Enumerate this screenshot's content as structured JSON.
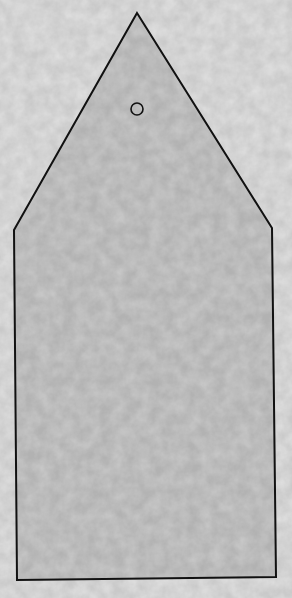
{
  "scene": {
    "description": "Gift tag outline on mottled gray paper texture",
    "background_color": "#cbcbcb",
    "tag_fill_color": "#b3b3b3",
    "outline_color": "#111111",
    "tag_shape": {
      "points": [
        [
          137,
          13
        ],
        [
          272,
          228
        ],
        [
          276,
          577
        ],
        [
          17,
          580
        ],
        [
          14,
          230
        ]
      ],
      "hole": {
        "cx": 137,
        "cy": 109,
        "r": 6
      }
    }
  }
}
